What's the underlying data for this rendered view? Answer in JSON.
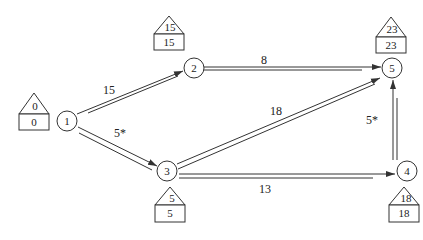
{
  "diagram": {
    "type": "network-graph",
    "nodes": [
      {
        "id": "1",
        "label": "1",
        "early": "0",
        "late": "0"
      },
      {
        "id": "2",
        "label": "2",
        "early": "15",
        "late": "15"
      },
      {
        "id": "3",
        "label": "3",
        "early": "5",
        "late": "5"
      },
      {
        "id": "4",
        "label": "4",
        "early": "18",
        "late": "18"
      },
      {
        "id": "5",
        "label": "5",
        "early": "23",
        "late": "23"
      }
    ],
    "edges": [
      {
        "from": "1",
        "to": "2",
        "label": "15"
      },
      {
        "from": "1",
        "to": "3",
        "label": "5*"
      },
      {
        "from": "2",
        "to": "5",
        "label": "8"
      },
      {
        "from": "3",
        "to": "5",
        "label": "18"
      },
      {
        "from": "3",
        "to": "4",
        "label": "13"
      },
      {
        "from": "4",
        "to": "5",
        "label": "5*"
      }
    ],
    "colors": {
      "line": "#333333",
      "background": "#ffffff"
    }
  }
}
